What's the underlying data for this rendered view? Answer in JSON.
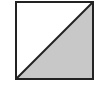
{
  "diagram": {
    "shape": "square-split-diagonally",
    "square": {
      "x": 16,
      "y": 2,
      "size": 77
    },
    "diagonal": {
      "from": "bottom-left",
      "to": "top-right"
    },
    "filled_region": "lower-right-triangle",
    "colors": {
      "stroke": "#222222",
      "fill_shaded": "#c8c8c8",
      "fill_unshaded": "#ffffff",
      "background": "#ffffff"
    }
  }
}
